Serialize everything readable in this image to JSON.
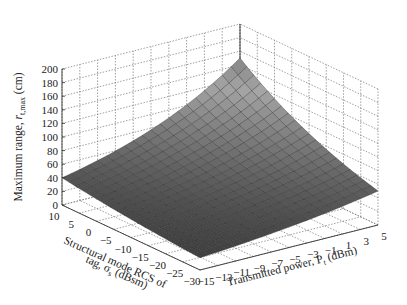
{
  "chart_data": {
    "type": "surface",
    "title": "",
    "zlabel": "Maximum range, r_t,max (cm)",
    "zlabel_main": "Maximum range, ",
    "zlabel_sym": "r",
    "zlabel_sub": "t,max",
    "zlabel_unit": " (cm)",
    "xlabel": "Transmitted power, P_t (dBm)",
    "xlabel_main": "Transmitted power, P",
    "xlabel_sub": "t",
    "xlabel_unit": " (dBm)",
    "ylabel_line1": "Structural mode RCS of",
    "ylabel_line2_main": "tag, σ",
    "ylabel_line2_sub": "s",
    "ylabel_line2_unit": " (dBsm)",
    "x_ticks": [
      "-15",
      "-13",
      "-11",
      "-9",
      "-7",
      "-5",
      "-3",
      "-1",
      "1",
      "3",
      "5"
    ],
    "x_values": [
      -15,
      -13,
      -11,
      -9,
      -7,
      -5,
      -3,
      -1,
      1,
      3,
      5
    ],
    "y_ticks": [
      "10",
      "5",
      "0",
      "-5",
      "-10",
      "-15",
      "-20",
      "-25",
      "-30"
    ],
    "y_values": [
      10,
      5,
      0,
      -5,
      -10,
      -15,
      -20,
      -25,
      -30
    ],
    "z_ticks": [
      "0",
      "20",
      "40",
      "60",
      "80",
      "100",
      "120",
      "140",
      "160",
      "180",
      "200"
    ],
    "z_values": [
      0,
      20,
      40,
      60,
      80,
      100,
      120,
      140,
      160,
      180,
      200
    ],
    "xlim": [
      -15,
      5
    ],
    "ylim": [
      -30,
      10
    ],
    "zlim": [
      0,
      200
    ],
    "grid": true,
    "surface_corners": {
      "P-15_sigma10": 40,
      "P5_sigma10": 150,
      "P5_sigma-30": 50,
      "P-15_sigma-30": 18
    },
    "surface_model": "r = a * 10^(P/40) * 10^(sigma/k), fitted to corner estimates",
    "colormap": "gray"
  }
}
